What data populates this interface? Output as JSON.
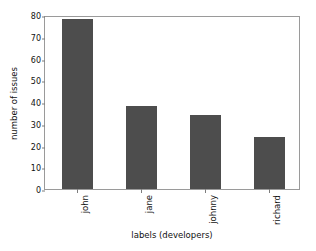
{
  "chart_data": {
    "type": "bar",
    "title": "",
    "subtitle": "",
    "categories": [
      "john",
      "jane",
      "johnny",
      "richard"
    ],
    "values": [
      78,
      38,
      34,
      24
    ],
    "series": [
      {
        "name": "number of issues",
        "values": [
          78,
          38,
          34,
          24
        ]
      }
    ],
    "xlabel": "labels (developers)",
    "ylabel": "number of issues",
    "ylim": [
      0,
      80
    ],
    "yticks": [
      0,
      10,
      20,
      30,
      40,
      50,
      60,
      70,
      80
    ],
    "ytick_labels": [
      "0",
      "10",
      "20",
      "30",
      "40",
      "50",
      "60",
      "70",
      "80"
    ],
    "xtick_labels": [
      "john",
      "jane",
      "johnny",
      "richard"
    ],
    "xtick_rotation": 90,
    "grid": false,
    "legend": false,
    "legend_position": "none",
    "bar_color": "#4d4d4d",
    "background_color": "#ffffff",
    "axes_edge_color": "#9a9a9a",
    "annotations": []
  }
}
